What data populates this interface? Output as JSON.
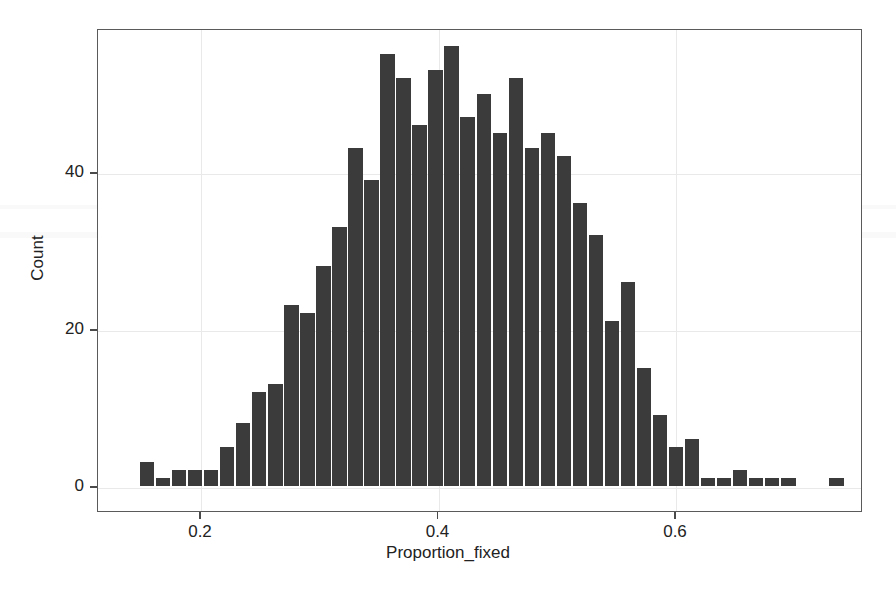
{
  "chart_data": {
    "type": "bar",
    "title": "",
    "subtitle": "",
    "xlabel": "Proportion_fixed",
    "ylabel": "Count",
    "grid": true,
    "legend": null,
    "xlim": [
      0.135,
      0.7425
    ],
    "ylim": [
      0,
      58
    ],
    "xticks": [
      0.2,
      0.4,
      0.6
    ],
    "xtick_labels": [
      "0.2",
      "0.4",
      "0.6"
    ],
    "yticks": [
      0,
      20,
      40
    ],
    "ytick_labels": [
      "0",
      "20",
      "40"
    ],
    "bar_color": "#3b3b3b",
    "bin_width": 0.0135,
    "bin_starts": [
      0.1485,
      0.162,
      0.1755,
      0.189,
      0.2025,
      0.216,
      0.2295,
      0.243,
      0.2565,
      0.27,
      0.2835,
      0.297,
      0.3105,
      0.324,
      0.3375,
      0.351,
      0.3645,
      0.378,
      0.3915,
      0.405,
      0.4185,
      0.432,
      0.4455,
      0.459,
      0.4725,
      0.486,
      0.4995,
      0.513,
      0.5265,
      0.54,
      0.5535,
      0.567,
      0.5805,
      0.594,
      0.6075,
      0.621,
      0.6345,
      0.648,
      0.6615,
      0.675,
      0.6885,
      0.702,
      0.7155,
      0.729
    ],
    "categories": [
      "0.149",
      "0.162",
      "0.176",
      "0.189",
      "0.203",
      "0.216",
      "0.230",
      "0.243",
      "0.257",
      "0.270",
      "0.284",
      "0.297",
      "0.311",
      "0.324",
      "0.338",
      "0.351",
      "0.365",
      "0.378",
      "0.392",
      "0.405",
      "0.419",
      "0.432",
      "0.446",
      "0.459",
      "0.473",
      "0.486",
      "0.500",
      "0.513",
      "0.527",
      "0.540",
      "0.554",
      "0.567",
      "0.581",
      "0.594",
      "0.608",
      "0.621",
      "0.635",
      "0.648",
      "0.662",
      "0.675",
      "0.689",
      "0.702",
      "0.716",
      "0.729"
    ],
    "values": [
      3,
      1,
      2,
      2,
      2,
      5,
      8,
      12,
      13,
      23,
      22,
      28,
      33,
      43,
      39,
      55,
      52,
      46,
      53,
      56,
      47,
      50,
      45,
      52,
      43,
      45,
      42,
      36,
      32,
      21,
      26,
      15,
      9,
      5,
      6,
      1,
      1,
      2,
      1,
      1,
      1,
      0,
      0,
      1
    ],
    "annotations": []
  },
  "axes": {
    "x_title": "Proportion_fixed",
    "y_title": "Count"
  }
}
